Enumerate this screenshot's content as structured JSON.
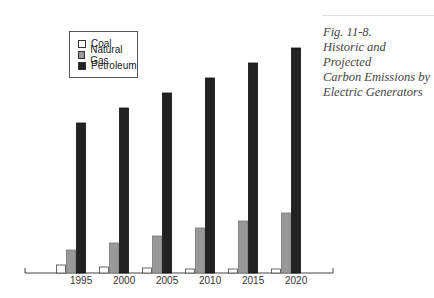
{
  "chart_data": {
    "type": "bar",
    "title": "Historic and Projected Carbon Emissions by Electric Generators",
    "figure_label": "Fig. 11-8.",
    "categories": [
      "1995",
      "2000",
      "2005",
      "2010",
      "2015",
      "2020"
    ],
    "series": [
      {
        "name": "Coal",
        "color": "#ffffff",
        "values": [
          8,
          6,
          5,
          4,
          4,
          4
        ]
      },
      {
        "name": "Natural Gas",
        "color": "#999999",
        "values": [
          23,
          30,
          37,
          45,
          52,
          60
        ]
      },
      {
        "name": "Petroleum",
        "color": "#222222",
        "values": [
          150,
          165,
          180,
          195,
          210,
          225
        ]
      }
    ],
    "xlabel": "",
    "ylabel": "",
    "y_units": "relative (no axis scale shown)",
    "grid": false,
    "legend_position": "top-left"
  },
  "legend": {
    "items": [
      {
        "label": "Coal",
        "color": "#ffffff"
      },
      {
        "label": "Natural Gas",
        "color": "#999999"
      },
      {
        "label": "Petroleum",
        "color": "#222222"
      }
    ]
  },
  "caption": {
    "line1": "Fig. 11-8.",
    "line2": "Historic and Projected",
    "line3": "Carbon Emissions by",
    "line4": "Electric Generators"
  }
}
